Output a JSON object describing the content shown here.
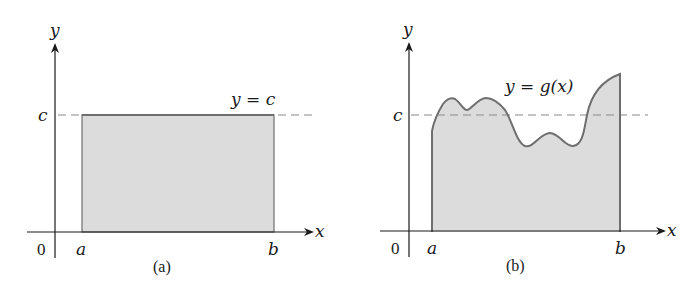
{
  "colors": {
    "axis": "#1a1a1a",
    "fill": "#dcdcdc",
    "curve": "#6e6e6e",
    "dashed": "#8a8a8a"
  },
  "panels": [
    {
      "caption": "(a)",
      "axis_labels": {
        "x": "x",
        "y": "y"
      },
      "origin_label": "0",
      "interval": {
        "a": "a",
        "b": "b"
      },
      "level_label": "c",
      "function_label": "y = c",
      "shape": "rectangle"
    },
    {
      "caption": "(b)",
      "axis_labels": {
        "x": "x",
        "y": "y"
      },
      "origin_label": "0",
      "interval": {
        "a": "a",
        "b": "b"
      },
      "level_label": "c",
      "function_label": "y = g(x)",
      "shape": "curve"
    }
  ]
}
